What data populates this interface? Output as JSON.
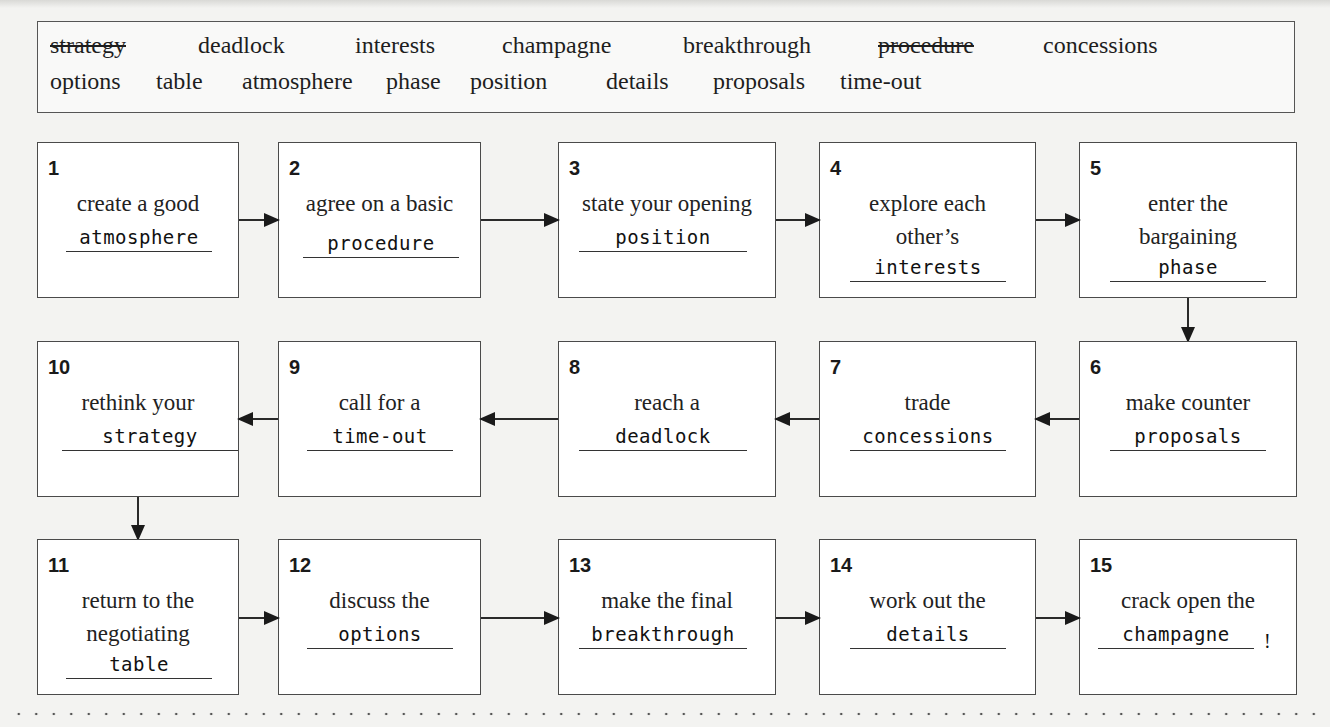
{
  "word_box": {
    "row1": [
      {
        "word": "strategy",
        "struck": true
      },
      {
        "word": "deadlock",
        "struck": false
      },
      {
        "word": "interests",
        "struck": false
      },
      {
        "word": "champagne",
        "struck": false
      },
      {
        "word": "breakthrough",
        "struck": false
      },
      {
        "word": "procedure",
        "struck": true
      },
      {
        "word": "concessions",
        "struck": false
      }
    ],
    "row2": [
      {
        "word": "options",
        "struck": false
      },
      {
        "word": "table",
        "struck": false
      },
      {
        "word": "atmosphere",
        "struck": false
      },
      {
        "word": "phase",
        "struck": false
      },
      {
        "word": "position",
        "struck": false
      },
      {
        "word": "details",
        "struck": false
      },
      {
        "word": "proposals",
        "struck": false
      },
      {
        "word": "time-out",
        "struck": false
      }
    ]
  },
  "steps": [
    {
      "num": "1",
      "text": "create a good",
      "answer": "atmosphere"
    },
    {
      "num": "2",
      "text": "agree on a basic",
      "answer": "procedure"
    },
    {
      "num": "3",
      "text": "state your opening",
      "answer": "position"
    },
    {
      "num": "4",
      "text": "explore each other’s",
      "answer": "interests"
    },
    {
      "num": "5",
      "text": "enter the bargaining",
      "answer": "phase"
    },
    {
      "num": "6",
      "text": "make counter",
      "answer": "proposals"
    },
    {
      "num": "7",
      "text": "trade",
      "answer": "concessions"
    },
    {
      "num": "8",
      "text": "reach a",
      "answer": "deadlock"
    },
    {
      "num": "9",
      "text": "call for a",
      "answer": "time-out"
    },
    {
      "num": "10",
      "text": "rethink your",
      "answer": "strategy"
    },
    {
      "num": "11",
      "text": "return to the negotiating",
      "answer": "table"
    },
    {
      "num": "12",
      "text": "discuss the",
      "answer": "options"
    },
    {
      "num": "13",
      "text": "make the final",
      "answer": "breakthrough"
    },
    {
      "num": "14",
      "text": "work out the",
      "answer": "details"
    },
    {
      "num": "15",
      "text": "crack open the",
      "answer": "champagne",
      "suffix": "!"
    }
  ]
}
